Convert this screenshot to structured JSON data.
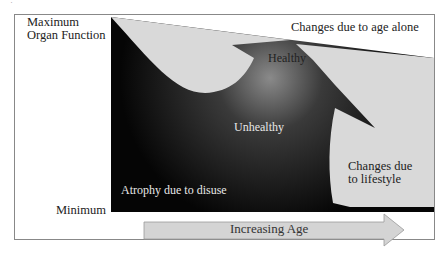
{
  "figure": {
    "top_mark": "a",
    "y_axis": {
      "max_label_line1": "Maximum",
      "max_label_line2": "Organ Function",
      "min_label": "Minimum"
    },
    "x_axis": {
      "arrow_label": "Increasing Age"
    },
    "regions": {
      "age_alone": "Changes due to age alone",
      "healthy": "Healthy",
      "unhealthy": "Unhealthy",
      "atrophy": "Atrophy  due to disuse",
      "lifestyle_line1": "Changes due",
      "lifestyle_line2": "to lifestyle"
    },
    "colors": {
      "dark_fill": "#0d0d0d",
      "light_fill": "#d9d9d9",
      "frame": "#888888",
      "arrow_fill": "#d4d4d4",
      "arrow_stroke": "#999999"
    }
  }
}
